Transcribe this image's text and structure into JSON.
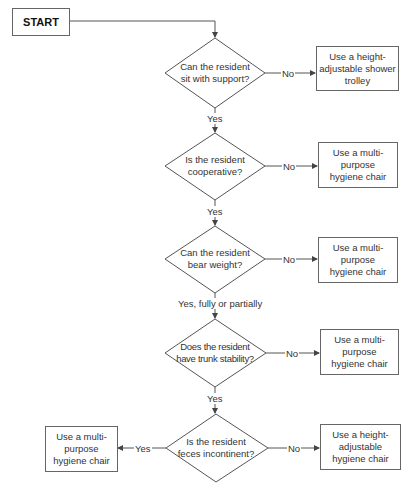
{
  "start": {
    "label": "START"
  },
  "decisions": [
    {
      "question_line1": "Can the resident",
      "question_line2": "sit with support?",
      "no_label": "No",
      "yes_label": "Yes"
    },
    {
      "question_line1": "Is the resident",
      "question_line2": "cooperative?",
      "no_label": "No",
      "yes_label": "Yes"
    },
    {
      "question_line1": "Can the resident",
      "question_line2": "bear weight?",
      "no_label": "No",
      "yes_label": "Yes, fully or partially"
    },
    {
      "question_line1": "Does the resident",
      "question_line2": "have trunk stability?",
      "no_label": "No",
      "yes_label": "Yes"
    },
    {
      "question_line1": "Is the resident",
      "question_line2": "feces incontinent?",
      "no_label": "No",
      "yes_label": "Yes"
    }
  ],
  "outcomes": {
    "o1": {
      "l1": "Use a height-",
      "l2": "adjustable shower",
      "l3": "trolley"
    },
    "o2": {
      "l1": "Use a multi-",
      "l2": "purpose",
      "l3": "hygiene chair"
    },
    "o3": {
      "l1": "Use a multi-",
      "l2": "purpose",
      "l3": "hygiene chair"
    },
    "o4": {
      "l1": "Use a multi-",
      "l2": "purpose",
      "l3": "hygiene chair"
    },
    "o5_yes": {
      "l1": "Use a multi-",
      "l2": "purpose",
      "l3": "hygiene chair"
    },
    "o5_no": {
      "l1": "Use a height-",
      "l2": "adjustable",
      "l3": "hygiene chair"
    }
  },
  "colors": {
    "line": "#555555",
    "text": "#333333"
  }
}
